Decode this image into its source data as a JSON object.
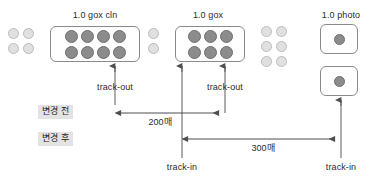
{
  "diagram": {
    "title_labels": [
      {
        "id": "gox-cln",
        "text": "1.0 gox cln",
        "x": 95,
        "y": 11
      },
      {
        "id": "gox",
        "text": "1.0 gox",
        "x": 208,
        "y": 11
      },
      {
        "id": "photo",
        "text": "1.0 photo",
        "x": 341,
        "y": 11
      }
    ],
    "stage_labels": [
      {
        "id": "track-out-left",
        "text": "track-out",
        "x": 115,
        "y": 83
      },
      {
        "id": "track-out-right",
        "text": "track-out",
        "x": 225,
        "y": 83
      },
      {
        "id": "track-in-middle",
        "text": "track-in",
        "x": 182,
        "y": 163
      },
      {
        "id": "track-in-right",
        "text": "track-in",
        "x": 341,
        "y": 163
      }
    ],
    "phase_chips": [
      {
        "id": "before",
        "text": "변경 전",
        "x": 38,
        "y": 105
      },
      {
        "id": "after",
        "text": "변경 후",
        "x": 38,
        "y": 132
      }
    ],
    "dimensions": [
      {
        "id": "dim-200",
        "text": "200매",
        "x": 160,
        "y": 122,
        "start_x": 115,
        "end_x": 225,
        "line_y": 113
      },
      {
        "id": "dim-300",
        "text": "300매",
        "x": 263,
        "y": 148,
        "start_x": 182,
        "end_x": 341,
        "line_y": 139
      }
    ],
    "cassettes": [
      {
        "id": "cassette-gox-cln",
        "x": 50,
        "y": 26,
        "w": 90,
        "h": 36,
        "cols": 4,
        "rows": 2,
        "dot": 13,
        "tone": "dark"
      },
      {
        "id": "cassette-gox",
        "x": 175,
        "y": 26,
        "w": 70,
        "h": 36,
        "cols": 3,
        "rows": 2,
        "dot": 13,
        "tone": "dark"
      },
      {
        "id": "cassette-photo-top",
        "x": 320,
        "y": 24,
        "w": 38,
        "h": 30,
        "cols": 1,
        "rows": 1,
        "dot": 11,
        "tone": "dark"
      },
      {
        "id": "cassette-photo-bottom",
        "x": 320,
        "y": 66,
        "w": 38,
        "h": 30,
        "cols": 1,
        "rows": 1,
        "dot": 11,
        "tone": "dark"
      }
    ],
    "loose_wafer_groups": [
      {
        "id": "loose-left",
        "x": 8,
        "y": 28,
        "cols": 2,
        "rows": 2,
        "dot": 11,
        "tone": "light"
      },
      {
        "id": "loose-middle",
        "x": 148,
        "y": 28,
        "cols": 1,
        "rows": 2,
        "dot": 11,
        "tone": "light"
      },
      {
        "id": "loose-right",
        "x": 261,
        "y": 26,
        "cols": 2,
        "rows": 3,
        "dot": 11,
        "tone": "light"
      }
    ],
    "connectors": [
      {
        "id": "arrow-track-out-left",
        "x": 115,
        "from_y": 105,
        "to_y": 64
      },
      {
        "id": "arrow-track-out-right",
        "x": 225,
        "from_y": 113,
        "to_y": 64
      },
      {
        "id": "arrow-track-in-middle",
        "x": 182,
        "from_y": 158,
        "to_y": 64
      },
      {
        "id": "arrow-track-in-right",
        "x": 341,
        "from_y": 158,
        "to_y": 98
      }
    ],
    "colors": {
      "stroke": "#5a5a5a",
      "dot_dark": "#8c8c8c",
      "dot_light": "#e0e0e0",
      "box_border": "#8a8a8a",
      "chip_bg": "#e3e3e3",
      "text": "#2b2b2b"
    }
  }
}
